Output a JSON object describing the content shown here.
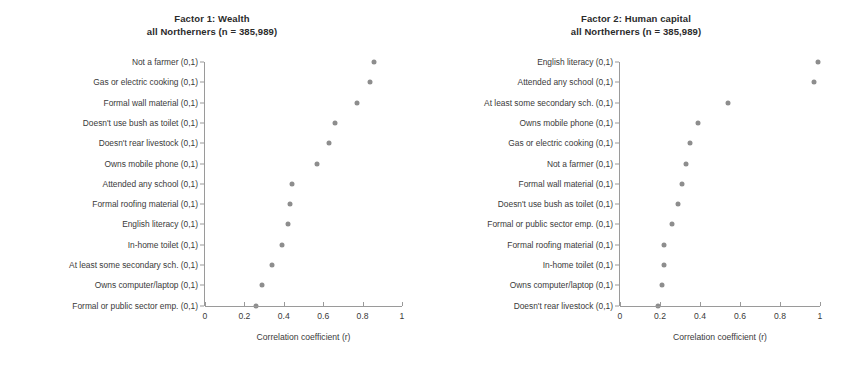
{
  "figure": {
    "background": "#ffffff",
    "point_color": "#8d8d8d",
    "axis_color": "#9a9a9a",
    "text_color": "#3a3a3a"
  },
  "chart_data": [
    {
      "type": "scatter",
      "title": "Factor 1: Wealth",
      "subtitle": "all Northerners (n = 385,989)",
      "xlabel": "Correlation coefficient (r)",
      "ylabel": "",
      "xlim": [
        0,
        1
      ],
      "xticks": [
        "0",
        "0.2",
        "0.4",
        "0.6",
        "0.8",
        "1"
      ],
      "xtickvalues": [
        0,
        0.2,
        0.4,
        0.6,
        0.8,
        1
      ],
      "grid": false,
      "legend": "none",
      "categories": [
        "Not a farmer (0,1)",
        "Gas or electric cooking (0,1)",
        "Formal wall material (0,1)",
        "Doesn't use bush as toilet (0,1)",
        "Doesn't rear livestock (0,1)",
        "Owns mobile phone (0,1)",
        "Attended any school (0,1)",
        "Formal roofing material (0,1)",
        "English literacy (0,1)",
        "In-home toilet (0,1)",
        "At least some secondary sch. (0,1)",
        "Owns computer/laptop (0,1)",
        "Formal or public sector emp. (0,1)"
      ],
      "values": [
        0.86,
        0.84,
        0.77,
        0.66,
        0.63,
        0.57,
        0.44,
        0.43,
        0.42,
        0.39,
        0.34,
        0.29,
        0.26
      ]
    },
    {
      "type": "scatter",
      "title": "Factor 2: Human capital",
      "subtitle": "all Northerners (n = 385,989)",
      "xlabel": "Correlation coefficient (r)",
      "ylabel": "",
      "xlim": [
        0,
        1
      ],
      "xticks": [
        "0",
        "0.2",
        "0.4",
        "0.6",
        "0.8",
        "1"
      ],
      "xtickvalues": [
        0,
        0.2,
        0.4,
        0.6,
        0.8,
        1
      ],
      "grid": false,
      "legend": "none",
      "categories": [
        "English literacy (0,1)",
        "Attended any school (0,1)",
        "At least some secondary sch. (0,1)",
        "Owns mobile phone (0,1)",
        "Gas or electric cooking (0,1)",
        "Not a farmer (0,1)",
        "Formal wall material (0,1)",
        "Doesn't use bush as toilet (0,1)",
        "Formal or public sector emp. (0,1)",
        "Formal roofing material (0,1)",
        "In-home toilet (0,1)",
        "Owns computer/laptop (0,1)",
        "Doesn't rear livestock (0,1)"
      ],
      "values": [
        0.99,
        0.97,
        0.54,
        0.39,
        0.35,
        0.33,
        0.31,
        0.29,
        0.26,
        0.22,
        0.22,
        0.21,
        0.19
      ]
    }
  ]
}
